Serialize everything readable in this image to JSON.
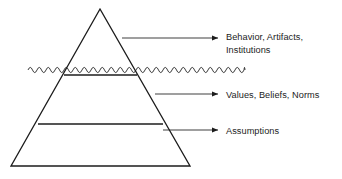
{
  "diagram": {
    "background_color": "#ffffff",
    "line_color": "#1c1c1c",
    "text_color": "#1c1c1c",
    "shape": {
      "name": "pyramid",
      "apex": {
        "x": 100,
        "y": 9
      },
      "base_left": {
        "x": 11,
        "y": 166
      },
      "base_right": {
        "x": 190,
        "y": 166
      }
    },
    "waterline": {
      "name": "wavy-line",
      "x_start": 28,
      "x_end": 245,
      "y": 70,
      "amplitude": 2.6,
      "wavelength": 9
    },
    "dividers": [
      {
        "name": "upper-divider",
        "x1": 64,
        "x2": 137,
        "y": 75
      },
      {
        "name": "lower-divider",
        "x1": 38,
        "x2": 163,
        "y": 124
      }
    ],
    "layers": [
      {
        "id": "top",
        "label_lines": [
          "Behavior, Artifacts,",
          "Institutions"
        ],
        "arrow": {
          "x1": 122,
          "x2": 218,
          "y": 38
        }
      },
      {
        "id": "middle",
        "label_lines": [
          "Values, Beliefs, Norms"
        ],
        "arrow": {
          "x1": 155,
          "x2": 218,
          "y": 94
        }
      },
      {
        "id": "bottom",
        "label_lines": [
          "Assumptions"
        ],
        "arrow": {
          "x1": 163,
          "x2": 218,
          "y": 130
        }
      }
    ]
  }
}
